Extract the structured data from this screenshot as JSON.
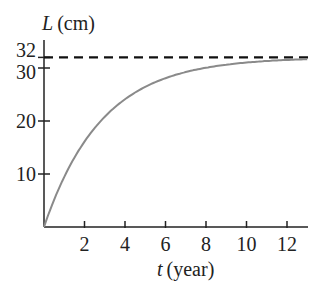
{
  "chart_data": {
    "type": "line",
    "title": "",
    "xlabel_var": "t",
    "xlabel_unit": "(year)",
    "ylabel_var": "L",
    "ylabel_unit": "(cm)",
    "xlim": [
      0,
      13
    ],
    "ylim": [
      0,
      34
    ],
    "x_ticks": [
      2,
      4,
      6,
      8,
      10,
      12
    ],
    "y_ticks": [
      10,
      20,
      30,
      32
    ],
    "grid": false,
    "legend": null,
    "series": [
      {
        "name": "L(t) = 32(1 - e^(-0.35t))",
        "color": "#8a8a8a",
        "x": [
          0,
          1,
          2,
          3,
          4,
          5,
          6,
          7,
          8,
          9,
          10,
          11,
          12,
          13
        ],
        "values": [
          0,
          9.4,
          16.1,
          20.8,
          24.1,
          26.5,
          28.2,
          29.4,
          30.2,
          30.8,
          31.2,
          31.5,
          31.7,
          31.8
        ]
      }
    ],
    "annotations": [
      {
        "type": "horizontal_dashed_line",
        "y": 32,
        "label": "asymptote",
        "color": "#111111"
      }
    ]
  }
}
